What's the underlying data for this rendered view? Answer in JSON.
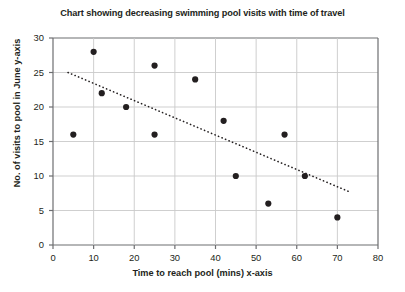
{
  "chart_data": {
    "type": "scatter",
    "title": "Chart showing decreasing swimming pool visits with time of travel",
    "xlabel": "Time to reach pool (mins)   x-axis",
    "ylabel": "No. of visits to pool in June   y-axis",
    "xlim": [
      0,
      80
    ],
    "ylim": [
      0,
      30
    ],
    "xticks": [
      0,
      10,
      20,
      30,
      40,
      50,
      60,
      70,
      80
    ],
    "yticks": [
      0,
      5,
      10,
      15,
      20,
      25,
      30
    ],
    "grid": true,
    "legend": "none",
    "point_color": "#231f20",
    "trendline_color": "#231f20",
    "points": [
      {
        "x": 5,
        "y": 16
      },
      {
        "x": 10,
        "y": 28
      },
      {
        "x": 12,
        "y": 22
      },
      {
        "x": 18,
        "y": 20
      },
      {
        "x": 25,
        "y": 26
      },
      {
        "x": 25,
        "y": 16
      },
      {
        "x": 35,
        "y": 24
      },
      {
        "x": 42,
        "y": 18
      },
      {
        "x": 45,
        "y": 10
      },
      {
        "x": 53,
        "y": 6
      },
      {
        "x": 57,
        "y": 16
      },
      {
        "x": 62,
        "y": 10
      },
      {
        "x": 70,
        "y": 4
      }
    ],
    "trendline": {
      "style": "dotted",
      "x0": 3.7,
      "y0": 25.0,
      "x1": 73.0,
      "y1": 7.7
    }
  },
  "colors": {
    "grid": "#c9c9c9",
    "axis": "#6d6e71",
    "text": "#231f20",
    "background": "#ffffff"
  }
}
